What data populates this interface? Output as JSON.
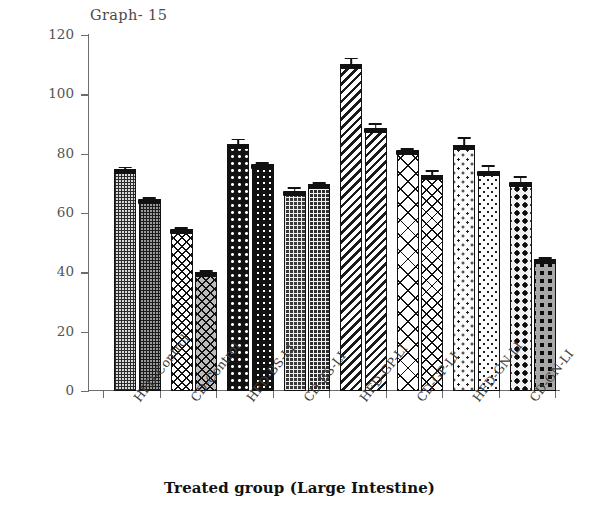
{
  "title": "Graph- 15",
  "axes": {
    "y_label": "SGOT (u/l)",
    "x_label": "Treated group (Large Intestine)",
    "y_ticks": [
      "0",
      "20",
      "40",
      "60",
      "80",
      "100",
      "120"
    ]
  },
  "chart_data": {
    "type": "bar",
    "title": "Graph- 15",
    "xlabel": "Treated group (Large Intestine)",
    "ylabel": "SGOT (u/l)",
    "ylim": [
      0,
      120
    ],
    "ytick_step": 20,
    "grid": false,
    "legend": "none",
    "error_bars": true,
    "categories": [
      "HFD-Control",
      "CD-Control",
      "HFD-BS-LI",
      "CD-BS-LI",
      "HFD-GP-LI",
      "CD-GP-LI",
      "HFD-GN-LI",
      "CD-GN-LI"
    ],
    "bars": [
      {
        "group": "HFD-Control",
        "index": 0,
        "value": 75.0,
        "error": 0.8,
        "fill": "fine-grid"
      },
      {
        "group": "HFD-Control",
        "index": 1,
        "value": 64.8,
        "error": 0.7,
        "fill": "fine-grid-dark"
      },
      {
        "group": "CD-Control",
        "index": 0,
        "value": 54.5,
        "error": 0.8,
        "fill": "diamond"
      },
      {
        "group": "CD-Control",
        "index": 1,
        "value": 40.0,
        "error": 0.7,
        "fill": "diamond-grey"
      },
      {
        "group": "HFD-BS-LI",
        "index": 0,
        "value": 83.4,
        "error": 2.0,
        "fill": "dot-black"
      },
      {
        "group": "HFD-BS-LI",
        "index": 1,
        "value": 76.5,
        "error": 0.8,
        "fill": "dot-black2"
      },
      {
        "group": "CD-BS-LI",
        "index": 0,
        "value": 67.4,
        "error": 1.8,
        "fill": "grid-dark"
      },
      {
        "group": "CD-BS-LI",
        "index": 1,
        "value": 69.8,
        "error": 0.9,
        "fill": "grid-dark2"
      },
      {
        "group": "HFD-GP-LI",
        "index": 0,
        "value": 110.3,
        "error": 2.4,
        "fill": "diag"
      },
      {
        "group": "HFD-GP-LI",
        "index": 1,
        "value": 88.8,
        "error": 1.9,
        "fill": "diag2"
      },
      {
        "group": "CD-GP-LI",
        "index": 0,
        "value": 81.3,
        "error": 1.0,
        "fill": "xhatch"
      },
      {
        "group": "CD-GP-LI",
        "index": 1,
        "value": 72.7,
        "error": 2.2,
        "fill": "xhatch2"
      },
      {
        "group": "HFD-GN-LI",
        "index": 0,
        "value": 82.8,
        "error": 3.0,
        "fill": "speckle"
      },
      {
        "group": "HFD-GN-LI",
        "index": 1,
        "value": 74.2,
        "error": 2.3,
        "fill": "speckle2"
      },
      {
        "group": "CD-GN-LI",
        "index": 0,
        "value": 70.3,
        "error": 2.6,
        "fill": "bigdot"
      },
      {
        "group": "CD-GN-LI",
        "index": 1,
        "value": 44.5,
        "error": 0.8,
        "fill": "bigdot-grey"
      }
    ]
  },
  "colors": {
    "axis": "#6d6d6d",
    "ink": "#111111",
    "tick_text": "#545454",
    "title_text": "#4a4a4a",
    "background": "#ffffff"
  }
}
